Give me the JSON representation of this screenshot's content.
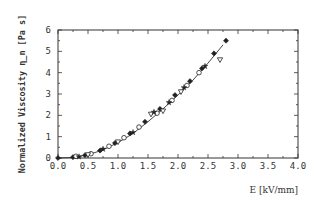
{
  "chart_data": {
    "type": "scatter",
    "title": "",
    "xlabel": "E [kV/mm]",
    "ylabel": "Normalized Viscosity η_n [Pa s]",
    "xlim": [
      0.0,
      4.0
    ],
    "ylim": [
      0,
      6
    ],
    "x_ticks": [
      "0.0",
      "0.5",
      "1.0",
      "1.5",
      "2.0",
      "2.5",
      "3.0",
      "3.5",
      "4.0"
    ],
    "y_ticks": [
      "0",
      "1",
      "2",
      "3",
      "4",
      "5",
      "6"
    ],
    "grid": false,
    "legend": null,
    "fit_curve": {
      "description": "smooth curve through data (approximately quadratic)",
      "x": [
        0.0,
        0.25,
        0.5,
        0.75,
        1.0,
        1.25,
        1.5,
        1.75,
        2.0,
        2.25,
        2.5,
        2.75
      ],
      "y": [
        0.0,
        0.03,
        0.15,
        0.38,
        0.72,
        1.15,
        1.7,
        2.3,
        2.95,
        3.65,
        4.45,
        5.3
      ]
    },
    "series": [
      {
        "name": "filled diamonds",
        "marker": "filled-diamond",
        "x": [
          0.0,
          0.25,
          0.45,
          0.7,
          0.95,
          1.2,
          1.45,
          1.7,
          1.95,
          2.2,
          2.4,
          2.6,
          2.8
        ],
        "y": [
          0.0,
          0.04,
          0.13,
          0.35,
          0.7,
          1.15,
          1.7,
          2.3,
          2.95,
          3.6,
          4.2,
          4.9,
          5.5
        ]
      },
      {
        "name": "open circles",
        "marker": "open-circle",
        "x": [
          0.3,
          0.55,
          0.85,
          1.1,
          1.35,
          1.65,
          1.9,
          2.15,
          2.35
        ],
        "y": [
          0.08,
          0.2,
          0.55,
          0.95,
          1.45,
          2.1,
          2.7,
          3.4,
          4.0
        ]
      },
      {
        "name": "open triangles",
        "marker": "open-triangle-down",
        "x": [
          0.5,
          1.0,
          1.55,
          1.75,
          2.05,
          2.7
        ],
        "y": [
          0.15,
          0.75,
          2.05,
          2.2,
          3.1,
          4.6
        ]
      },
      {
        "name": "filled stars",
        "marker": "filled-star",
        "x": [
          0.35,
          0.75,
          1.25,
          1.6,
          1.85,
          2.1,
          2.45
        ],
        "y": [
          0.06,
          0.42,
          1.2,
          2.15,
          2.6,
          3.3,
          4.3
        ]
      }
    ]
  }
}
